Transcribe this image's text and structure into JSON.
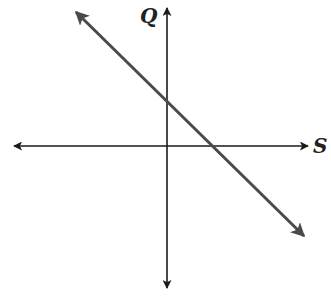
{
  "diagram": {
    "type": "coordinate-axes-with-line",
    "axes": {
      "vertical_label": "Q",
      "horizontal_label": "S",
      "color": "#1a1a1a"
    },
    "line": {
      "description": "downward-sloping line with arrowheads at both ends, positive Q-intercept and positive S-intercept",
      "color": "#4a4a4a",
      "slope_sign": "negative"
    }
  }
}
